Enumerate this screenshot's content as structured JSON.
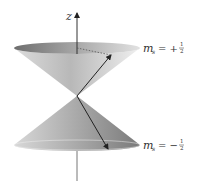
{
  "diagram": {
    "axis": {
      "label": "z"
    },
    "states": [
      {
        "name": "spin-up",
        "symbol": "m",
        "subscript": "s",
        "sign": "= +",
        "num": "1",
        "den": "2"
      },
      {
        "name": "spin-down",
        "symbol": "m",
        "subscript": "s",
        "sign": "= −",
        "num": "1",
        "den": "2"
      }
    ],
    "colors": {
      "cone_light": "#e8e8e8",
      "cone_dark": "#8a8a8a",
      "line": "#222222"
    }
  }
}
